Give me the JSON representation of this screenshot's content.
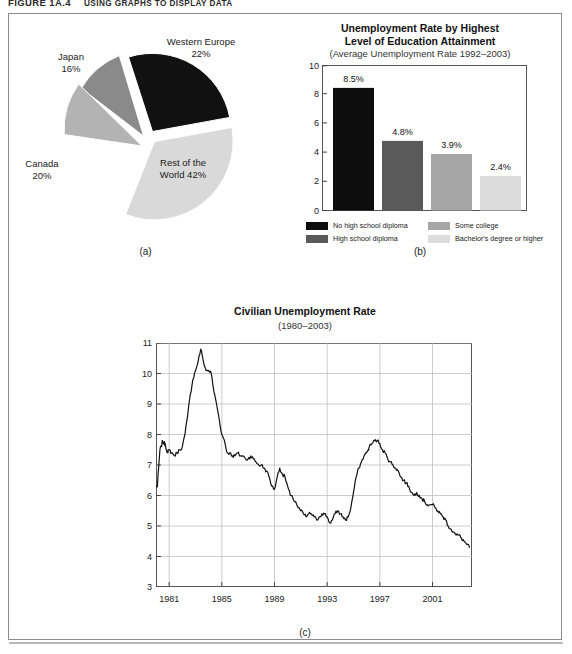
{
  "figure_header": {
    "label": "Figure 1A.4",
    "title": "Using Graphs to Display Data"
  },
  "panel_a": {
    "caption": "(a)",
    "chart_data": {
      "type": "pie",
      "title": "",
      "categories": [
        "Western Europe",
        "Rest of the World",
        "Canada",
        "Japan"
      ],
      "values": [
        22,
        42,
        20,
        16
      ],
      "labels": [
        {
          "name": "Western Europe",
          "value": "22%",
          "text": "Western Europe\n22%",
          "color": "#111111",
          "placement": "outside-top-right"
        },
        {
          "name": "Rest of the World",
          "value": "42%",
          "text": "Rest of the\nWorld 42%",
          "color": "#d9d9d9",
          "placement": "inside"
        },
        {
          "name": "Canada",
          "value": "20%",
          "text": "Canada\n20%",
          "color": "#b3b3b3",
          "placement": "outside-left"
        },
        {
          "name": "Japan",
          "value": "16%",
          "text": "Japan\n16%",
          "color": "#8a8a8a",
          "placement": "outside-top-left"
        }
      ],
      "label_wedge_1_line1": "Western Europe",
      "label_wedge_1_line2": "22%",
      "label_wedge_2_line1": "Rest of the",
      "label_wedge_2_line2": "World 42%",
      "label_wedge_3_line1": "Canada",
      "label_wedge_3_line2": "20%",
      "label_wedge_4_line1": "Japan",
      "label_wedge_4_line2": "16%",
      "exploded": true,
      "legend": "none"
    }
  },
  "panel_b": {
    "caption": "(b)",
    "chart_data": {
      "type": "bar",
      "title_line1": "Unemployment Rate by Highest",
      "title_line2": "Level of Education Attainment",
      "subtitle": "(Average Unemployment Rate 1992–2003)",
      "categories": [
        "No high school diploma",
        "High school diploma",
        "Some college",
        "Bachelor's degree or higher"
      ],
      "values": [
        8.5,
        4.8,
        3.9,
        2.4
      ],
      "value_labels": [
        "8.5%",
        "4.8%",
        "3.9%",
        "2.4%"
      ],
      "colors": [
        "#0d0d0d",
        "#5a5a5a",
        "#a6a6a6",
        "#dcdcdc"
      ],
      "ylim": [
        0,
        10
      ],
      "yticks": [
        "0",
        "2",
        "4",
        "6",
        "8",
        "10"
      ],
      "ytick_values": [
        0,
        2,
        4,
        6,
        8,
        10
      ],
      "xlabel": "",
      "ylabel": "",
      "grid": false,
      "legend_position": "below",
      "legend": [
        {
          "label": "No high school diploma",
          "color": "#0d0d0d"
        },
        {
          "label": "Some college",
          "color": "#a6a6a6"
        },
        {
          "label": "High school diploma",
          "color": "#5a5a5a"
        },
        {
          "label": "Bachelor's degree or higher",
          "color": "#dcdcdc"
        }
      ]
    }
  },
  "panel_c": {
    "caption": "(c)",
    "chart_data": {
      "type": "line",
      "title": "Civilian Unemployment  Rate",
      "subtitle": "(1980–2003)",
      "xlabel": "",
      "ylabel": "",
      "xlim": [
        1980,
        2004
      ],
      "ylim": [
        3,
        11
      ],
      "yticks": [
        "3",
        "4",
        "5",
        "6",
        "7",
        "8",
        "9",
        "10",
        "11"
      ],
      "ytick_values": [
        3,
        4,
        5,
        6,
        7,
        8,
        9,
        10,
        11
      ],
      "xticks": [
        "1981",
        "1985",
        "1989",
        "1993",
        "1997",
        "2001"
      ],
      "xtick_values": [
        1981,
        1985,
        1989,
        1993,
        1997,
        2001
      ],
      "grid": true,
      "line_color": "#111111",
      "series": [
        {
          "name": "Civilian Unemployment Rate",
          "x": [
            1980.0,
            1980.1,
            1980.2,
            1980.3,
            1980.4,
            1980.5,
            1980.6,
            1980.7,
            1980.8,
            1980.9,
            1981.0,
            1981.2,
            1981.4,
            1981.6,
            1981.8,
            1982.0,
            1982.2,
            1982.4,
            1982.6,
            1982.8,
            1983.0,
            1983.2,
            1983.4,
            1983.6,
            1983.8,
            1984.0,
            1984.2,
            1984.4,
            1984.6,
            1984.8,
            1985.0,
            1985.2,
            1985.4,
            1985.6,
            1985.8,
            1986.0,
            1986.2,
            1986.4,
            1986.6,
            1986.8,
            1987.0,
            1987.2,
            1987.4,
            1987.6,
            1987.8,
            1988.0,
            1988.2,
            1988.4,
            1988.6,
            1988.8,
            1989.0,
            1989.2,
            1989.4,
            1989.6,
            1989.8,
            1990.0,
            1990.2,
            1990.4,
            1990.6,
            1990.8,
            1991.0,
            1991.2,
            1991.4,
            1991.6,
            1991.8,
            1992.0,
            1992.2,
            1992.4,
            1992.6,
            1992.8,
            1993.0,
            1993.2,
            1993.4,
            1993.6,
            1993.8,
            1994.0,
            1994.2,
            1994.4,
            1994.6,
            1994.8,
            1995.0,
            1995.2,
            1995.4,
            1995.6,
            1995.8,
            1996.0,
            1996.2,
            1996.4,
            1996.6,
            1996.8,
            1997.0,
            1997.2,
            1997.4,
            1997.6,
            1997.8,
            1998.0,
            1998.2,
            1998.4,
            1998.6,
            1998.8,
            1999.0,
            1999.2,
            1999.4,
            1999.6,
            1999.8,
            2000.0,
            2000.2,
            2000.4,
            2000.6,
            2000.8,
            2001.0,
            2001.2,
            2001.4,
            2001.6,
            2001.8,
            2002.0,
            2002.2,
            2002.4,
            2002.6,
            2002.8,
            2003.0,
            2003.2,
            2003.4,
            2003.6,
            2003.8
          ],
          "values": [
            6.3,
            6.3,
            6.9,
            7.5,
            7.6,
            7.8,
            7.7,
            7.7,
            7.5,
            7.4,
            7.5,
            7.4,
            7.3,
            7.4,
            7.5,
            7.6,
            8.0,
            8.6,
            9.3,
            9.8,
            10.1,
            10.4,
            10.8,
            10.4,
            10.1,
            10.1,
            10.0,
            9.4,
            9.0,
            8.5,
            8.0,
            7.8,
            7.4,
            7.4,
            7.3,
            7.3,
            7.4,
            7.3,
            7.3,
            7.2,
            7.2,
            7.3,
            7.2,
            7.1,
            7.0,
            7.0,
            6.9,
            6.8,
            6.6,
            6.3,
            6.2,
            6.6,
            6.9,
            6.7,
            6.6,
            6.3,
            6.0,
            5.9,
            5.8,
            5.6,
            5.5,
            5.4,
            5.3,
            5.4,
            5.4,
            5.3,
            5.2,
            5.3,
            5.4,
            5.4,
            5.3,
            5.1,
            5.2,
            5.4,
            5.5,
            5.4,
            5.3,
            5.2,
            5.3,
            5.6,
            6.1,
            6.6,
            6.9,
            7.1,
            7.3,
            7.4,
            7.6,
            7.7,
            7.8,
            7.8,
            7.7,
            7.5,
            7.4,
            7.2,
            7.1,
            7.0,
            6.9,
            6.8,
            6.6,
            6.5,
            6.4,
            6.3,
            6.1,
            6.0,
            6.1,
            6.0,
            5.9,
            5.8,
            5.7,
            5.7,
            5.7,
            5.6,
            5.5,
            5.4,
            5.3,
            5.2,
            5.0,
            4.9,
            4.8,
            4.7,
            4.7,
            4.6,
            4.5,
            4.4,
            4.3,
            4.3,
            4.2,
            4.2,
            4.1,
            4.1
          ]
        }
      ],
      "annotations": [
        {
          "text": "peak 10.8 in 1982",
          "x": 1982.9,
          "y": 10.8
        },
        {
          "text": "trough 3.9 in 2000",
          "x": 2000.4,
          "y": 3.9
        }
      ]
    }
  }
}
